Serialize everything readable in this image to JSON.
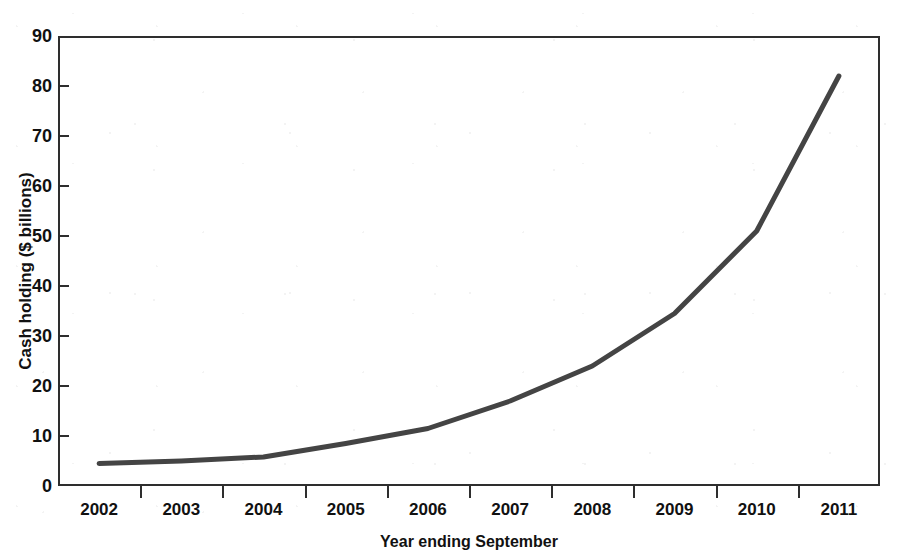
{
  "figure": {
    "background_color": "#ffffff",
    "frame_color": "#2e2e2e",
    "top_clipped_caption": ""
  },
  "chart_data": {
    "type": "line",
    "title": "",
    "xlabel": "Year ending September",
    "ylabel": "Cash holding ($ billions)",
    "categories": [
      "2002",
      "2003",
      "2004",
      "2005",
      "2006",
      "2007",
      "2008",
      "2009",
      "2010",
      "2011"
    ],
    "values": [
      4.5,
      5.0,
      5.8,
      8.5,
      11.5,
      17.0,
      24.0,
      34.5,
      51.0,
      82.0
    ],
    "series": [
      {
        "name": "Cash holding",
        "color": "#444444",
        "values": [
          4.5,
          5.0,
          5.8,
          8.5,
          11.5,
          17.0,
          24.0,
          34.5,
          51.0,
          82.0
        ]
      }
    ],
    "ylim": [
      0,
      90
    ],
    "y_ticks": [
      0,
      10,
      20,
      30,
      40,
      50,
      60,
      70,
      80,
      90
    ],
    "y_tick_labels": [
      "0",
      "10",
      "20",
      "30",
      "40",
      "50",
      "60",
      "70",
      "80",
      "90"
    ],
    "x_tick_labels": [
      "2002",
      "2003",
      "2004",
      "2005",
      "2006",
      "2007",
      "2008",
      "2009",
      "2010",
      "2011"
    ],
    "grid": false,
    "legend": "none",
    "line_width_px": 5,
    "marker": "none"
  }
}
